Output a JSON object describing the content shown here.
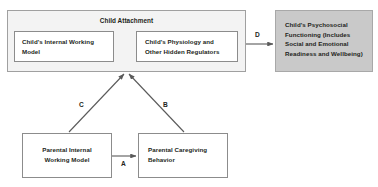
{
  "diagram": {
    "nodes": {
      "attachment_group": {
        "label": "Child Attachment",
        "fill": "#f3f3f3",
        "stroke": "#a0a0a0"
      },
      "child_internal_working_model": {
        "label": "Child's Internal Working Model",
        "fill": "#ffffff",
        "stroke": "#8c8c8c"
      },
      "child_physiology": {
        "label": "Child's Physiology and Other Hidden Regulators",
        "fill": "#ffffff",
        "stroke": "#8c8c8c"
      },
      "child_psychosocial": {
        "label": "Child's Psychosocial Functioning (Includes Social and Emotional Readiness and Wellbeing)",
        "fill": "#c9c9c9",
        "stroke": "#a8a8a8"
      },
      "parental_internal_working_model": {
        "label": "Parental Internal Working Model",
        "fill": "#ffffff",
        "stroke": "#8c8c8c"
      },
      "parental_caregiving_behavior": {
        "label": "Parental Caregiving Behavior",
        "fill": "#ffffff",
        "stroke": "#8c8c8c"
      }
    },
    "edges": {
      "a": {
        "label": "A",
        "from": "parental_internal_working_model",
        "to": "parental_caregiving_behavior",
        "arrow": "single"
      },
      "b": {
        "label": "B",
        "from": "parental_caregiving_behavior",
        "to": "attachment_group",
        "arrow": "single"
      },
      "c": {
        "label": "C",
        "from": "parental_internal_working_model",
        "to": "attachment_group",
        "arrow": "single"
      },
      "d": {
        "label": "D",
        "from": "attachment_group",
        "to": "child_psychosocial",
        "arrow": "single"
      },
      "internal_bidirectional": {
        "label": "",
        "from": "child_internal_working_model",
        "to": "child_physiology",
        "arrow": "double"
      }
    },
    "edge_color": "#5a5a5a"
  }
}
